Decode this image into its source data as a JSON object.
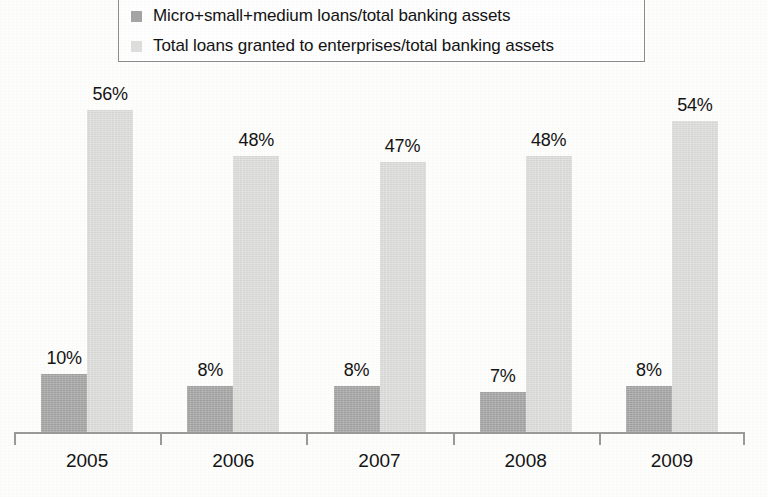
{
  "chart_data": {
    "type": "bar",
    "title": "",
    "xlabel": "",
    "ylabel": "",
    "categories": [
      "2005",
      "2006",
      "2007",
      "2008",
      "2009"
    ],
    "series": [
      {
        "name": "Micro+small+medium loans/total banking assets",
        "color": "#a5a5a5",
        "values": [
          10,
          8,
          8,
          7,
          8
        ],
        "labels": [
          "10%",
          "8%",
          "8%",
          "7%",
          "8%"
        ]
      },
      {
        "name": "Total loans granted to enterprises/total banking assets",
        "color": "#dededc",
        "values": [
          56,
          48,
          47,
          48,
          54
        ],
        "labels": [
          "56%",
          "48%",
          "47%",
          "48%",
          "54%"
        ]
      }
    ],
    "unit": "%",
    "ylim": [
      0,
      62
    ],
    "grid": false,
    "legend_position": "top"
  },
  "legend": {
    "entries": [
      {
        "marker": "legend-swatch-dark",
        "label": "Micro+small+medium loans/total banking assets"
      },
      {
        "marker": "legend-swatch-light",
        "label": "Total loans granted to enterprises/total banking assets"
      }
    ]
  },
  "axis": {
    "tick_labels": [
      "2005",
      "2006",
      "2007",
      "2008",
      "2009"
    ]
  },
  "colors": {
    "series_dark": "#a5a5a5",
    "series_light": "#dededc",
    "axis": "#9a9a9a",
    "text": "#141414",
    "legend_border": "#8d8d8d",
    "background": "#fdfdfb"
  }
}
